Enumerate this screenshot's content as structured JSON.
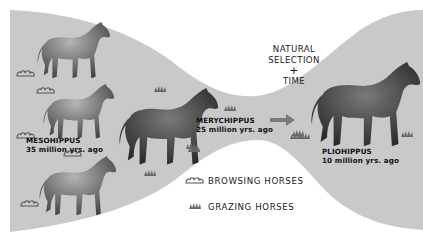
{
  "diagram": {
    "title_lines": [
      "NATURAL",
      "SELECTION",
      "+",
      "TIME"
    ],
    "species": [
      {
        "name": "MESOHIPPUS",
        "age": "35 million yrs. ago"
      },
      {
        "name": "MERYCHIPPUS",
        "age": "25 million yrs. ago"
      },
      {
        "name": "PLIOHIPPUS",
        "age": "10 million yrs. ago"
      }
    ],
    "legend": [
      {
        "icon": "browsing-shrub-icon",
        "label": "BROWSING HORSES"
      },
      {
        "icon": "grazing-grass-icon",
        "label": "GRAZING HORSES"
      }
    ],
    "colors": {
      "band": "#c9c9c9",
      "background": "#ffffff",
      "horse_dark": "#2a2a2a",
      "horse_mid": "#6d6d6d",
      "arrow": "#7a7a7a"
    }
  }
}
